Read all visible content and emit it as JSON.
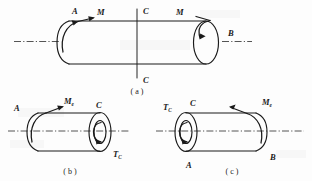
{
  "figure": {
    "background_color": "#fdfdfd",
    "line_color": "#1a1a1a"
  },
  "panels": [
    {
      "id": "a",
      "caption": "( a )",
      "caption_text": "(a)",
      "description": "Full shaft AB loaded by equal and opposite torques M at both ends, cut plane C-C at mid-span",
      "labels": {
        "left_end": "A",
        "right_end": "B",
        "left_torque": "M",
        "right_torque": "M",
        "section_top": "C",
        "section_bottom": "C"
      }
    },
    {
      "id": "b",
      "caption": "( b )",
      "caption_text": "(b)",
      "description": "Left free body: segment from end A to cut section C showing applied torque Me and internal torque Tc",
      "labels": {
        "left_end": "A",
        "applied_torque": "M",
        "applied_torque_sub": "e",
        "section": "C",
        "internal_torque": "T",
        "internal_torque_sub": "C"
      }
    },
    {
      "id": "c",
      "caption": "( c )",
      "caption_text": "(c)",
      "description": "Right free body: segment from cut section C to end B showing internal torque Tc and applied torque Me",
      "labels": {
        "section": "C",
        "internal_torque": "T",
        "internal_torque_sub": "C",
        "bottom_end": "A",
        "applied_torque": "M",
        "applied_torque_sub": "e",
        "right_end": "B"
      }
    }
  ]
}
